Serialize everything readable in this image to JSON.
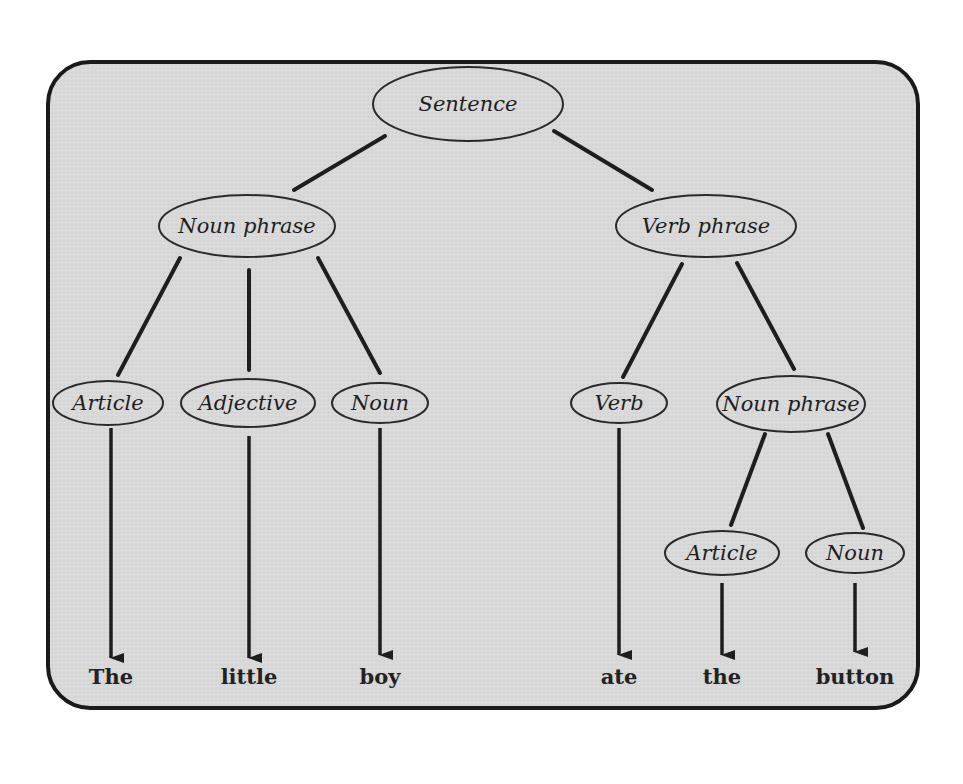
{
  "diagram": {
    "title": "Sentence parse tree",
    "colors": {
      "panel_fill": "#d9d9d9",
      "panel_stroke": "#1a1a1a",
      "ellipse_stroke": "#2a2a2a",
      "line": "#1e1e1e",
      "text": "#1e1e1e",
      "page_bg": "#ffffff"
    },
    "panel": {
      "x": 48,
      "y": 62,
      "width": 870,
      "height": 646,
      "radius": 42
    },
    "nodes": [
      {
        "id": "sentence",
        "label": "Sentence",
        "cx": 468,
        "cy": 104,
        "rx": 95,
        "ry": 37
      },
      {
        "id": "noun-phrase-1",
        "label": "Noun phrase",
        "cx": 247,
        "cy": 226,
        "rx": 88,
        "ry": 31
      },
      {
        "id": "verb-phrase",
        "label": "Verb phrase",
        "cx": 706,
        "cy": 226,
        "rx": 90,
        "ry": 31
      },
      {
        "id": "article-1",
        "label": "Article",
        "cx": 108,
        "cy": 403,
        "rx": 55,
        "ry": 22
      },
      {
        "id": "adjective",
        "label": "Adjective",
        "cx": 248,
        "cy": 403,
        "rx": 67,
        "ry": 24
      },
      {
        "id": "noun-1",
        "label": "Noun",
        "cx": 380,
        "cy": 403,
        "rx": 48,
        "ry": 20
      },
      {
        "id": "verb",
        "label": "Verb",
        "cx": 619,
        "cy": 403,
        "rx": 48,
        "ry": 20
      },
      {
        "id": "noun-phrase-2",
        "label": "Noun phrase",
        "cx": 791,
        "cy": 404,
        "rx": 74,
        "ry": 28
      },
      {
        "id": "article-2",
        "label": "Article",
        "cx": 722,
        "cy": 553,
        "rx": 57,
        "ry": 22
      },
      {
        "id": "noun-2",
        "label": "Noun",
        "cx": 855,
        "cy": 553,
        "rx": 49,
        "ry": 20
      }
    ],
    "edges": [
      {
        "from": "sentence",
        "to": "noun-phrase-1",
        "x1": 385,
        "y1": 136,
        "x2": 294,
        "y2": 190
      },
      {
        "from": "sentence",
        "to": "verb-phrase",
        "x1": 554,
        "y1": 131,
        "x2": 652,
        "y2": 190
      },
      {
        "from": "noun-phrase-1",
        "to": "article-1",
        "x1": 180,
        "y1": 258,
        "x2": 118,
        "y2": 375
      },
      {
        "from": "noun-phrase-1",
        "to": "adjective",
        "x1": 249,
        "y1": 270,
        "x2": 249,
        "y2": 370
      },
      {
        "from": "noun-phrase-1",
        "to": "noun-1",
        "x1": 318,
        "y1": 258,
        "x2": 380,
        "y2": 373
      },
      {
        "from": "verb-phrase",
        "to": "verb",
        "x1": 682,
        "y1": 264,
        "x2": 623,
        "y2": 377
      },
      {
        "from": "verb-phrase",
        "to": "noun-phrase-2",
        "x1": 737,
        "y1": 263,
        "x2": 794,
        "y2": 369
      },
      {
        "from": "noun-phrase-2",
        "to": "article-2",
        "x1": 765,
        "y1": 434,
        "x2": 731,
        "y2": 525
      },
      {
        "from": "noun-phrase-2",
        "to": "noun-2",
        "x1": 828,
        "y1": 434,
        "x2": 863,
        "y2": 528
      }
    ],
    "leaves": [
      {
        "word": "The",
        "from": "article-1",
        "x": 111,
        "y_start": 428,
        "y_end": 658,
        "label_y": 684
      },
      {
        "word": "little",
        "from": "adjective",
        "x": 249,
        "y_start": 436,
        "y_end": 658,
        "label_y": 684
      },
      {
        "word": "boy",
        "from": "noun-1",
        "x": 380,
        "y_start": 428,
        "y_end": 655,
        "label_y": 684
      },
      {
        "word": "ate",
        "from": "verb",
        "x": 619,
        "y_start": 428,
        "y_end": 655,
        "label_y": 684
      },
      {
        "word": "the",
        "from": "article-2",
        "x": 722,
        "y_start": 583,
        "y_end": 655,
        "label_y": 684
      },
      {
        "word": "button",
        "from": "noun-2",
        "x": 855,
        "y_start": 583,
        "y_end": 652,
        "label_y": 684
      }
    ],
    "sentence_text": "The little boy ate the button"
  }
}
